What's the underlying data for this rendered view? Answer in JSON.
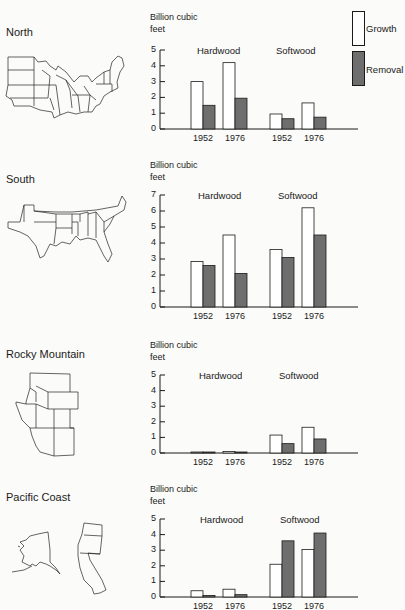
{
  "legend": {
    "items": [
      {
        "label": "Growth",
        "fill": "#ffffff"
      },
      {
        "label": "Removal",
        "fill": "#6e6e6e"
      }
    ]
  },
  "colors": {
    "growth": "#ffffff",
    "removal": "#6e6e6e",
    "stroke": "#1a1a1a"
  },
  "panels": [
    {
      "region": "North",
      "unit_line1": "Billion cubic",
      "unit_line2": "feet",
      "groups": [
        "Hardwood",
        "Softwood"
      ],
      "years": [
        "1952",
        "1976",
        "1952",
        "1976"
      ],
      "ticks": [
        "0",
        "1",
        "2",
        "3",
        "4",
        "5"
      ]
    },
    {
      "region": "South",
      "unit_line1": "Billion cubic",
      "unit_line2": "feet",
      "groups": [
        "Hardwood",
        "Softwood"
      ],
      "years": [
        "1952",
        "1976",
        "1952",
        "1976"
      ],
      "ticks": [
        "0",
        "1",
        "2",
        "3",
        "4",
        "5",
        "6",
        "7"
      ]
    },
    {
      "region": "Rocky Mountain",
      "unit_line1": "Billion cubic",
      "unit_line2": "feet",
      "groups": [
        "Hardwood",
        "Softwood"
      ],
      "years": [
        "1952",
        "1976",
        "1952",
        "1976"
      ],
      "ticks": [
        "0",
        "1",
        "2",
        "3",
        "4",
        "5"
      ]
    },
    {
      "region": "Pacific Coast",
      "unit_line1": "Billion cubic",
      "unit_line2": "feet",
      "groups": [
        "Hardwood",
        "Softwood"
      ],
      "years": [
        "1952",
        "1976",
        "1952",
        "1976"
      ],
      "ticks": [
        "0",
        "1",
        "2",
        "3",
        "4",
        "5"
      ]
    }
  ],
  "chart_data": [
    {
      "type": "bar",
      "title": "North",
      "ylabel": "Billion cubic feet",
      "ylim": [
        0,
        5
      ],
      "categories": [
        "Hardwood 1952",
        "Hardwood 1976",
        "Softwood 1952",
        "Softwood 1976"
      ],
      "series": [
        {
          "name": "Growth",
          "values": [
            3.0,
            4.2,
            0.95,
            1.65
          ]
        },
        {
          "name": "Removal",
          "values": [
            1.5,
            1.95,
            0.65,
            0.75
          ]
        }
      ],
      "legend_position": "top-right",
      "grid": false
    },
    {
      "type": "bar",
      "title": "South",
      "ylabel": "Billion cubic feet",
      "ylim": [
        0,
        7
      ],
      "categories": [
        "Hardwood 1952",
        "Hardwood 1976",
        "Softwood 1952",
        "Softwood 1976"
      ],
      "series": [
        {
          "name": "Growth",
          "values": [
            2.85,
            4.5,
            3.6,
            6.2
          ]
        },
        {
          "name": "Removal",
          "values": [
            2.6,
            2.1,
            3.1,
            4.5
          ]
        }
      ],
      "grid": false
    },
    {
      "type": "bar",
      "title": "Rocky Mountain",
      "ylabel": "Billion cubic feet",
      "ylim": [
        0,
        5
      ],
      "categories": [
        "Hardwood 1952",
        "Hardwood 1976",
        "Softwood 1952",
        "Softwood 1976"
      ],
      "series": [
        {
          "name": "Growth",
          "values": [
            0.05,
            0.1,
            1.15,
            1.65
          ]
        },
        {
          "name": "Removal",
          "values": [
            0.02,
            0.05,
            0.6,
            0.9
          ]
        }
      ],
      "grid": false
    },
    {
      "type": "bar",
      "title": "Pacific Coast",
      "ylabel": "Billion cubic feet",
      "ylim": [
        0,
        5
      ],
      "categories": [
        "Hardwood 1952",
        "Hardwood 1976",
        "Softwood 1952",
        "Softwood 1976"
      ],
      "series": [
        {
          "name": "Growth",
          "values": [
            0.4,
            0.5,
            2.1,
            3.05
          ]
        },
        {
          "name": "Removal",
          "values": [
            0.1,
            0.15,
            3.6,
            4.1
          ]
        }
      ],
      "grid": false
    }
  ]
}
